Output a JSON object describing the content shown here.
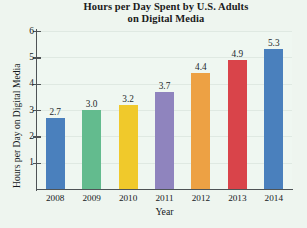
{
  "chart_data": {
    "type": "bar",
    "title": "Hours per Day Spent by U.S. Adults on Digital Media",
    "title_line1": "Hours per Day Spent by U.S. Adults",
    "title_line2": "on Digital Media",
    "xlabel": "Year",
    "ylabel": "Hours per Day on Digital Media",
    "categories": [
      "2008",
      "2009",
      "2010",
      "2011",
      "2012",
      "2013",
      "2014"
    ],
    "values": [
      2.7,
      3.0,
      3.2,
      3.7,
      4.4,
      4.9,
      5.3
    ],
    "value_labels": [
      "2.7",
      "3.0",
      "3.2",
      "3.7",
      "4.4",
      "4.9",
      "5.3"
    ],
    "colors": [
      "#4a80bd",
      "#63bb8e",
      "#f0c92b",
      "#8f84be",
      "#eda144",
      "#d9444a",
      "#4a80bd"
    ],
    "ylim": [
      0,
      6
    ],
    "yticks": [
      1,
      2,
      3,
      4,
      5,
      6
    ],
    "ytick_labels": [
      "1",
      "2",
      "3",
      "4",
      "5",
      "6"
    ],
    "grid": true,
    "legend": null,
    "background_color": "#eff7f1",
    "axis_color": "#4e5356",
    "grid_color": "#dfe9e2"
  }
}
